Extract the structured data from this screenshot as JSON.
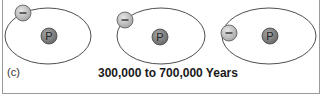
{
  "figure": {
    "panel_label": "(c)",
    "caption": "300,000 to 700,000 Years",
    "atoms": [
      {
        "nucleus_label": "P",
        "electron_label": "–",
        "orbit": {
          "cx": 48,
          "cy": 36,
          "rx": 43,
          "ry": 28
        },
        "nucleus": {
          "cx": 49,
          "cy": 36
        },
        "electron": {
          "cx": 23,
          "cy": 13
        }
      },
      {
        "nucleus_label": "P",
        "electron_label": "–",
        "orbit": {
          "cx": 161,
          "cy": 36,
          "rx": 44,
          "ry": 28
        },
        "nucleus": {
          "cx": 160,
          "cy": 37
        },
        "electron": {
          "cx": 125,
          "cy": 20
        }
      },
      {
        "nucleus_label": "P",
        "electron_label": "–",
        "orbit": {
          "cx": 268,
          "cy": 36,
          "rx": 47,
          "ry": 28
        },
        "nucleus": {
          "cx": 270,
          "cy": 36
        },
        "electron": {
          "cx": 229,
          "cy": 33
        }
      }
    ],
    "colors": {
      "orbit": "#3a3a3a",
      "nucleus_fill": "#808080",
      "electron_fill": "#c8c8c8",
      "border": "#9a9a9a"
    }
  }
}
